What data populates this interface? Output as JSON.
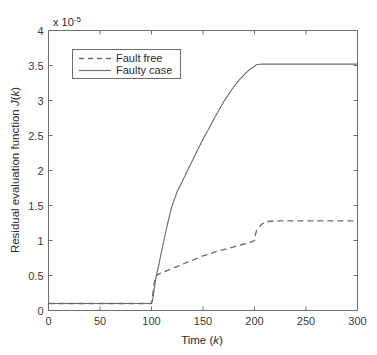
{
  "chart_data": {
    "type": "line",
    "title": "",
    "xlabel": "Time (k)",
    "ylabel": "Residual evaluation function J(k)",
    "ylabel_plain": "Residual evaluation function ",
    "ylabel_symbol": "J",
    "ylabel_symbol_tail": "(",
    "ylabel_symbol_k": "k",
    "ylabel_symbol_close": ")",
    "xlabel_plain": "Time (",
    "xlabel_symbol": "k",
    "xlabel_close": ")",
    "y_exponent_prefix": "x 10",
    "y_exponent_power": "-5",
    "y_scale_note": "x 10^-5",
    "xlim": [
      0,
      300
    ],
    "ylim": [
      0,
      4
    ],
    "xticks": [
      0,
      50,
      100,
      150,
      200,
      250,
      300
    ],
    "xtick_labels": [
      "0",
      "50",
      "100",
      "150",
      "200",
      "250",
      "300"
    ],
    "yticks": [
      0,
      0.5,
      1,
      1.5,
      2,
      2.5,
      3,
      3.5,
      4
    ],
    "ytick_labels": [
      "0",
      "0.5",
      "1",
      "1.5",
      "2",
      "2.5",
      "3",
      "3.5",
      "4"
    ],
    "grid": false,
    "legend_position": "upper left",
    "line_color": "#6a6a6a",
    "axis_color": "#6e6e6e",
    "background_color": "#ffffff",
    "series": [
      {
        "name": "Fault free",
        "style": "dashed",
        "x": [
          0,
          10,
          20,
          30,
          40,
          50,
          60,
          70,
          80,
          90,
          95,
          99,
          100,
          101,
          102,
          103,
          104,
          105,
          107,
          110,
          115,
          120,
          125,
          130,
          135,
          140,
          145,
          150,
          155,
          160,
          165,
          170,
          175,
          180,
          185,
          190,
          195,
          199,
          200,
          201,
          202,
          203,
          204,
          205,
          207,
          210,
          215,
          220,
          230,
          240,
          250,
          260,
          270,
          280,
          290,
          300
        ],
        "y": [
          0.1,
          0.1,
          0.1,
          0.1,
          0.1,
          0.1,
          0.1,
          0.1,
          0.1,
          0.1,
          0.1,
          0.1,
          0.11,
          0.2,
          0.32,
          0.42,
          0.47,
          0.5,
          0.52,
          0.54,
          0.57,
          0.6,
          0.63,
          0.66,
          0.69,
          0.72,
          0.75,
          0.78,
          0.8,
          0.83,
          0.85,
          0.87,
          0.89,
          0.91,
          0.93,
          0.95,
          0.97,
          0.99,
          1.0,
          1.09,
          1.14,
          1.16,
          1.18,
          1.2,
          1.23,
          1.26,
          1.275,
          1.28,
          1.28,
          1.28,
          1.28,
          1.28,
          1.28,
          1.28,
          1.28,
          1.28
        ]
      },
      {
        "name": "Faulty case",
        "style": "solid",
        "x": [
          0,
          10,
          20,
          30,
          40,
          50,
          60,
          70,
          80,
          90,
          95,
          99,
          100,
          101,
          102,
          103,
          104,
          105,
          106,
          107,
          108,
          110,
          112,
          115,
          118,
          120,
          123,
          125,
          128,
          130,
          133,
          135,
          138,
          140,
          145,
          150,
          155,
          160,
          165,
          170,
          175,
          180,
          185,
          190,
          195,
          198,
          200,
          202,
          204,
          206,
          208,
          210,
          215,
          220,
          230,
          240,
          250,
          260,
          270,
          280,
          290,
          300
        ],
        "y": [
          0.1,
          0.1,
          0.1,
          0.1,
          0.1,
          0.1,
          0.1,
          0.1,
          0.1,
          0.1,
          0.1,
          0.1,
          0.1,
          0.14,
          0.24,
          0.34,
          0.44,
          0.52,
          0.58,
          0.64,
          0.72,
          0.86,
          1.0,
          1.2,
          1.38,
          1.5,
          1.62,
          1.7,
          1.79,
          1.85,
          1.94,
          2.0,
          2.09,
          2.15,
          2.3,
          2.45,
          2.58,
          2.72,
          2.85,
          2.98,
          3.09,
          3.2,
          3.29,
          3.37,
          3.44,
          3.47,
          3.49,
          3.51,
          3.515,
          3.52,
          3.52,
          3.52,
          3.52,
          3.52,
          3.52,
          3.52,
          3.52,
          3.52,
          3.52,
          3.52,
          3.52,
          3.52
        ]
      }
    ]
  },
  "legend": {
    "entries": [
      {
        "label": "Fault free",
        "style": "dashed"
      },
      {
        "label": "Faulty case",
        "style": "solid"
      }
    ]
  }
}
